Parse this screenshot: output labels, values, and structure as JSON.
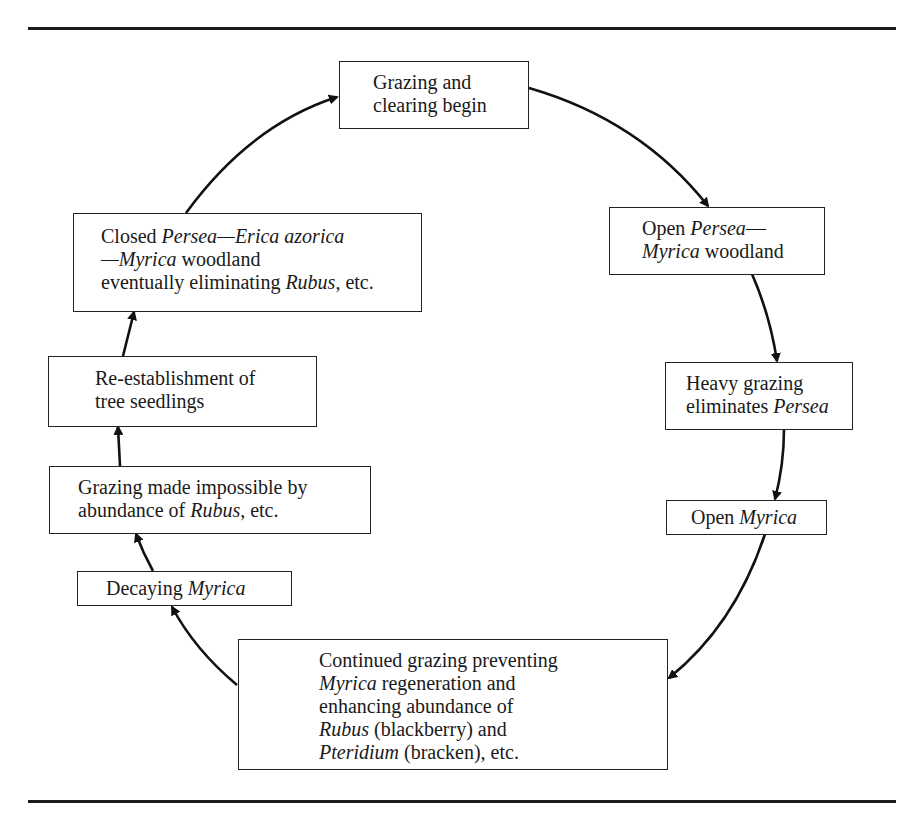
{
  "diagram": {
    "type": "cycle",
    "nodes": [
      {
        "id": "n1",
        "lines": [
          [
            {
              "t": "Grazing and"
            }
          ],
          [
            {
              "t": "clearing begin"
            }
          ]
        ]
      },
      {
        "id": "n2",
        "lines": [
          [
            {
              "t": "Open "
            },
            {
              "t": "Persea",
              "i": true
            },
            {
              "t": "—"
            }
          ],
          [
            {
              "t": "Myrica",
              "i": true
            },
            {
              "t": " woodland"
            }
          ]
        ]
      },
      {
        "id": "n3",
        "lines": [
          [
            {
              "t": "Heavy grazing"
            }
          ],
          [
            {
              "t": "eliminates "
            },
            {
              "t": "Persea",
              "i": true
            }
          ]
        ]
      },
      {
        "id": "n4",
        "lines": [
          [
            {
              "t": "Open "
            },
            {
              "t": "Myrica",
              "i": true
            }
          ]
        ]
      },
      {
        "id": "n5",
        "lines": [
          [
            {
              "t": "Continued grazing preventing"
            }
          ],
          [
            {
              "t": "Myrica",
              "i": true
            },
            {
              "t": " regeneration and"
            }
          ],
          [
            {
              "t": "enhancing abundance of"
            }
          ],
          [
            {
              "t": "Rubus",
              "i": true
            },
            {
              "t": " (blackberry) and"
            }
          ],
          [
            {
              "t": "Pteridium",
              "i": true
            },
            {
              "t": " (bracken), etc."
            }
          ]
        ]
      },
      {
        "id": "n6",
        "lines": [
          [
            {
              "t": "Decaying "
            },
            {
              "t": "Myrica",
              "i": true
            }
          ]
        ]
      },
      {
        "id": "n7",
        "lines": [
          [
            {
              "t": "Grazing made impossible by"
            }
          ],
          [
            {
              "t": "abundance of "
            },
            {
              "t": "Rubus",
              "i": true
            },
            {
              "t": ", etc."
            }
          ]
        ]
      },
      {
        "id": "n8",
        "lines": [
          [
            {
              "t": "Re-establishment of"
            }
          ],
          [
            {
              "t": "tree seedlings"
            }
          ]
        ]
      },
      {
        "id": "n9",
        "lines": [
          [
            {
              "t": "Closed "
            },
            {
              "t": "Persea—Erica azorica",
              "i": true
            }
          ],
          [
            {
              "t": "—Myrica",
              "i": true
            },
            {
              "t": " woodland"
            }
          ],
          [
            {
              "t": "eventually eliminating "
            },
            {
              "t": "Rubus",
              "i": true
            },
            {
              "t": ", etc."
            }
          ]
        ]
      }
    ],
    "edges": [
      {
        "from": "n1",
        "to": "n2"
      },
      {
        "from": "n2",
        "to": "n3"
      },
      {
        "from": "n3",
        "to": "n4"
      },
      {
        "from": "n4",
        "to": "n5"
      },
      {
        "from": "n5",
        "to": "n6"
      },
      {
        "from": "n6",
        "to": "n7"
      },
      {
        "from": "n7",
        "to": "n8"
      },
      {
        "from": "n8",
        "to": "n9"
      },
      {
        "from": "n9",
        "to": "n1"
      }
    ]
  }
}
